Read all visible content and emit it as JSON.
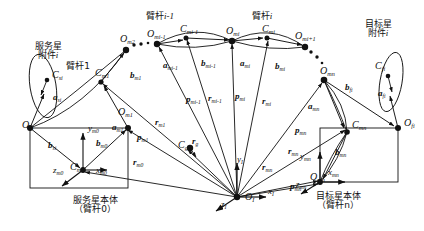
{
  "figure": {
    "type": "kinematics-diagram",
    "title_cjk_groups": {
      "service_attachment": "服务星\n附件i",
      "service_base": "服务星本体\n（臂杆0）",
      "target_attachment": "目标星\n附件i",
      "target_base": "目标星本体\n（臂杆n）",
      "link1": "臂杆1",
      "link_i_minus_1": "臂杆i-1",
      "link_i": "臂杆i"
    },
    "colors": {
      "ink": "#111111",
      "paper": "#ffffff"
    }
  },
  "labels": {
    "cjk": [
      {
        "id": "service-attachment-caption",
        "line1": "服务星",
        "line2": "附件",
        "italic_suffix": "i",
        "x": 48,
        "y": 42
      },
      {
        "id": "link1-caption",
        "line1": "臂杆1",
        "italic_suffix": "",
        "x": 78,
        "y": 62
      },
      {
        "id": "link-i-minus-1-caption",
        "line1": "臂杆",
        "italic_suffix": "i-1",
        "x": 160,
        "y": 12
      },
      {
        "id": "link-i-caption",
        "line1": "臂杆",
        "italic_suffix": "i",
        "x": 262,
        "y": 12
      },
      {
        "id": "target-attachment-caption",
        "line1": "目标星",
        "line2": "附件",
        "italic_suffix": "i",
        "x": 378,
        "y": 20
      },
      {
        "id": "service-base-caption",
        "line1": "服务星本体",
        "line2": "（臂杆0）",
        "x": 95,
        "y": 196
      },
      {
        "id": "target-base-caption",
        "line1": "目标星本体",
        "line2": "（臂杆n）",
        "x": 338,
        "y": 192
      }
    ],
    "points": [
      {
        "id": "O-si",
        "base": "O",
        "sub": "si",
        "x": 22,
        "y": 120
      },
      {
        "id": "C-si",
        "base": "C",
        "sub": "si",
        "x": 52,
        "y": 70
      },
      {
        "id": "O-m1",
        "base": "O",
        "sub": "m1",
        "x": 118,
        "y": 107
      },
      {
        "id": "C-m1",
        "base": "C",
        "sub": "m1",
        "x": 95,
        "y": 68
      },
      {
        "id": "O-m2",
        "base": "O",
        "sub": "m2",
        "x": 120,
        "y": 34
      },
      {
        "id": "C-m0",
        "base": "C",
        "sub": "m0",
        "x": 70,
        "y": 162
      },
      {
        "id": "O-mi-1",
        "base": "O",
        "sub": "mi-1",
        "x": 147,
        "y": 29
      },
      {
        "id": "C-mi-1",
        "base": "C",
        "sub": "mi-1",
        "x": 180,
        "y": 24
      },
      {
        "id": "O-mi",
        "base": "O",
        "sub": "mi",
        "x": 226,
        "y": 26
      },
      {
        "id": "C-mi",
        "base": "C",
        "sub": "mi",
        "x": 262,
        "y": 24
      },
      {
        "id": "O-mi+1",
        "base": "O",
        "sub": "mi+1",
        "x": 295,
        "y": 31
      },
      {
        "id": "O-mn",
        "base": "O",
        "sub": "mn",
        "x": 320,
        "y": 66
      },
      {
        "id": "C-mn",
        "base": "C",
        "sub": "mn",
        "x": 352,
        "y": 120
      },
      {
        "id": "O-mc",
        "base": "O",
        "sub": "mn",
        "x": 310,
        "y": 172
      },
      {
        "id": "C-fi",
        "base": "C",
        "sub": "fi",
        "x": 375,
        "y": 61
      },
      {
        "id": "O-fi",
        "base": "O",
        "sub": "fi",
        "x": 404,
        "y": 118
      },
      {
        "id": "C-g",
        "base": "C",
        "sub": "g",
        "x": 178,
        "y": 140
      },
      {
        "id": "O-I",
        "base": "O",
        "sub": "I",
        "x": 245,
        "y": 192
      }
    ],
    "vectors": [
      {
        "id": "a-si",
        "base": "a",
        "sub": "si",
        "x": 53,
        "y": 93
      },
      {
        "id": "b-si",
        "base": "b",
        "sub": "si",
        "x": 48,
        "y": 141
      },
      {
        "id": "b-m0",
        "base": "b",
        "sub": "m0",
        "x": 96,
        "y": 139
      },
      {
        "id": "a-m1",
        "base": "a",
        "sub": "m1",
        "x": 112,
        "y": 123
      },
      {
        "id": "b-m1",
        "base": "b",
        "sub": "m1",
        "x": 130,
        "y": 71
      },
      {
        "id": "a-mi-1",
        "base": "a",
        "sub": "mi-1",
        "x": 163,
        "y": 61
      },
      {
        "id": "b-mi-1",
        "base": "b",
        "sub": "mi-1",
        "x": 201,
        "y": 59
      },
      {
        "id": "a-mi",
        "base": "a",
        "sub": "mi",
        "x": 240,
        "y": 59
      },
      {
        "id": "b-mi",
        "base": "b",
        "sub": "mi",
        "x": 275,
        "y": 62
      },
      {
        "id": "a-mn",
        "base": "a",
        "sub": "mn",
        "x": 308,
        "y": 102
      },
      {
        "id": "b-mn",
        "base": "b",
        "sub": "mn",
        "x": 335,
        "y": 148
      },
      {
        "id": "a-fi",
        "base": "a",
        "sub": "fi",
        "x": 378,
        "y": 89
      },
      {
        "id": "b-fi",
        "base": "b",
        "sub": "fi",
        "x": 345,
        "y": 83
      },
      {
        "id": "p-m1",
        "base": "p",
        "sub": "m1",
        "x": 137,
        "y": 133
      },
      {
        "id": "r-m1",
        "base": "r",
        "sub": "m1",
        "x": 155,
        "y": 118
      },
      {
        "id": "r-m0",
        "base": "r",
        "sub": "m0",
        "x": 133,
        "y": 158
      },
      {
        "id": "p-mi-1",
        "base": "p",
        "sub": "mi-1",
        "x": 186,
        "y": 95
      },
      {
        "id": "r-mi-1",
        "base": "r",
        "sub": "mi-1",
        "x": 208,
        "y": 94
      },
      {
        "id": "p-mi",
        "base": "p",
        "sub": "mi",
        "x": 235,
        "y": 92
      },
      {
        "id": "r-mi",
        "base": "r",
        "sub": "mi",
        "x": 262,
        "y": 97
      },
      {
        "id": "p-mn",
        "base": "p",
        "sub": "mn",
        "x": 295,
        "y": 126
      },
      {
        "id": "r-mn",
        "base": "r",
        "sub": "mn",
        "x": 288,
        "y": 147
      },
      {
        "id": "r-mc",
        "base": "r",
        "sub": "mn",
        "x": 262,
        "y": 163
      },
      {
        "id": "p-mc",
        "base": "p",
        "sub": "mn",
        "x": 290,
        "y": 182
      },
      {
        "id": "r-g",
        "base": "r",
        "sub": "g",
        "x": 192,
        "y": 137
      }
    ],
    "axes": [
      {
        "id": "x-m0",
        "base": "x",
        "sub": "m0",
        "x": 96,
        "y": 166
      },
      {
        "id": "y-m0",
        "base": "y",
        "sub": "m0",
        "x": 88,
        "y": 124
      },
      {
        "id": "z-m0",
        "base": "z",
        "sub": "m0",
        "x": 53,
        "y": 166
      },
      {
        "id": "x-mn",
        "base": "x",
        "sub": "mn",
        "x": 328,
        "y": 168
      },
      {
        "id": "y-mn",
        "base": "y",
        "sub": "mn",
        "x": 300,
        "y": 152
      },
      {
        "id": "z-mn",
        "base": "z",
        "sub": "mn",
        "x": 296,
        "y": 180
      },
      {
        "id": "x-I",
        "base": "x",
        "sub": "I",
        "x": 268,
        "y": 187
      },
      {
        "id": "y-I",
        "base": "y",
        "sub": "I",
        "x": 237,
        "y": 155
      },
      {
        "id": "z-I",
        "base": "z",
        "sub": "I",
        "x": 221,
        "y": 200
      }
    ],
    "ellipsis": [
      {
        "id": "dots-left",
        "x": 132,
        "y": 39
      },
      {
        "id": "dots-right",
        "x": 305,
        "y": 45
      }
    ]
  },
  "geometry": {
    "nodes": {
      "O_si": [
        30,
        128
      ],
      "C_si": [
        47,
        80
      ],
      "O_m1": [
        128,
        128
      ],
      "C_m1": [
        101,
        82
      ],
      "O_m2": [
        126,
        50
      ],
      "C_m0": [
        83,
        170
      ],
      "O_mi_1": [
        157,
        44
      ],
      "C_mi_1": [
        186,
        38
      ],
      "O_mi": [
        232,
        41
      ],
      "C_mi": [
        267,
        38
      ],
      "O_mi_1p": [
        305,
        47
      ],
      "O_mn": [
        324,
        80
      ],
      "C_mn": [
        347,
        132
      ],
      "O_mnb": [
        320,
        182
      ],
      "C_fi": [
        388,
        76
      ],
      "O_fi": [
        398,
        128
      ],
      "C_g": [
        190,
        148
      ],
      "O_I": [
        237,
        197
      ]
    }
  }
}
